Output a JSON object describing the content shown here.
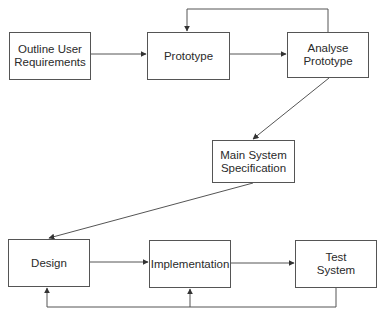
{
  "diagram": {
    "type": "flowchart",
    "title": "",
    "nodes": [
      {
        "id": "outline",
        "label": "Outline User\nRequirements",
        "x": 9,
        "y": 32,
        "w": 82,
        "h": 48
      },
      {
        "id": "prototype",
        "label": "Prototype",
        "x": 147,
        "y": 32,
        "w": 83,
        "h": 48
      },
      {
        "id": "analyse",
        "label": "Analyse\nPrototype",
        "x": 287,
        "y": 32,
        "w": 82,
        "h": 46
      },
      {
        "id": "mainspec",
        "label": "Main System\nSpecification",
        "x": 212,
        "y": 140,
        "w": 83,
        "h": 43
      },
      {
        "id": "design",
        "label": "Design",
        "x": 8,
        "y": 239,
        "w": 82,
        "h": 48
      },
      {
        "id": "implementation",
        "label": "Implementation",
        "x": 149,
        "y": 240,
        "w": 82,
        "h": 48
      },
      {
        "id": "test",
        "label": "Test\nSystem",
        "x": 295,
        "y": 240,
        "w": 82,
        "h": 48
      }
    ],
    "edges": [
      {
        "from": "outline",
        "to": "prototype"
      },
      {
        "from": "prototype",
        "to": "analyse"
      },
      {
        "from": "analyse",
        "to": "prototype",
        "note": "feedback loop over top"
      },
      {
        "from": "analyse",
        "to": "mainspec"
      },
      {
        "from": "mainspec",
        "to": "design"
      },
      {
        "from": "design",
        "to": "implementation"
      },
      {
        "from": "implementation",
        "to": "test"
      },
      {
        "from": "test",
        "to": "design",
        "note": "feedback loop along bottom"
      },
      {
        "from": "test",
        "to": "implementation",
        "note": "feedback loop along bottom"
      }
    ],
    "colors": {
      "stroke": "#555555",
      "text": "#2a2a2a",
      "background": "#ffffff"
    }
  }
}
